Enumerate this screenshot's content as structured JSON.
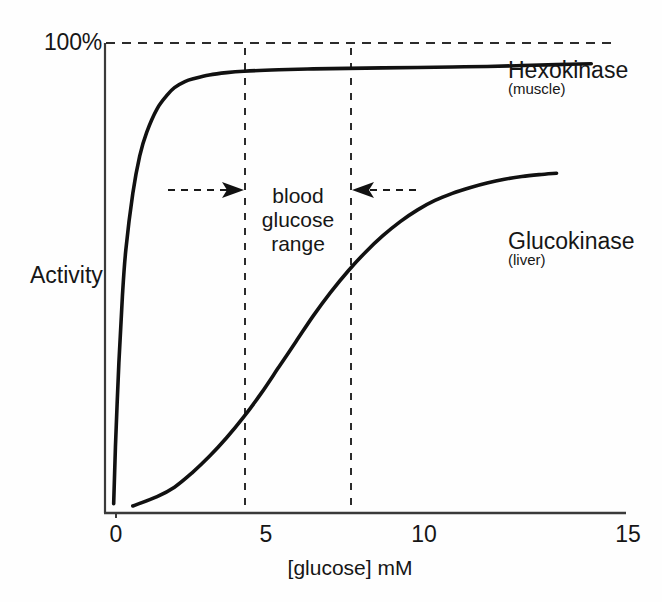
{
  "chart_data": {
    "type": "line",
    "title": "",
    "subtitle": "",
    "xlabel": "[glucose] mM",
    "ylabel": "Activity",
    "xlim": [
      0,
      15
    ],
    "ylim": [
      0,
      100
    ],
    "xticks": [
      0,
      5,
      10,
      15
    ],
    "xticklabels": [
      "0",
      "5",
      "10",
      "15"
    ],
    "yticklabels": [
      "100%"
    ],
    "grid": false,
    "legend_position": "inline-right-of-curves",
    "reference_lines": [
      {
        "name": "100-percent-line",
        "orientation": "horizontal",
        "value": 100,
        "style": "dashed",
        "label": "100%"
      },
      {
        "name": "blood-glucose-range-lower",
        "orientation": "vertical",
        "value": 4,
        "style": "dashed"
      },
      {
        "name": "blood-glucose-range-upper",
        "orientation": "vertical",
        "value": 7,
        "style": "dashed"
      }
    ],
    "annotations": [
      {
        "name": "blood-glucose-range",
        "text_lines": [
          "blood",
          "glucose",
          "range"
        ],
        "x_range": [
          4,
          7
        ],
        "y": 62
      }
    ],
    "series": [
      {
        "name": "Hexokinase",
        "sublabel": "(muscle)",
        "color": "#111111",
        "x": [
          0.25,
          0.3,
          0.4,
          0.5,
          0.6,
          0.8,
          1.0,
          1.2,
          1.5,
          1.8,
          2.0,
          2.3,
          2.6,
          3.0,
          3.5,
          4.0,
          5.0,
          6.0,
          7.0,
          8.0,
          9.0,
          10.0,
          11.0,
          12.0,
          13.0,
          14.0
        ],
        "y": [
          2,
          14,
          32,
          46,
          56,
          68,
          76,
          81,
          86,
          89,
          90.5,
          91.8,
          92.5,
          93.2,
          93.7,
          94.0,
          94.3,
          94.5,
          94.6,
          94.7,
          94.8,
          94.9,
          95.0,
          95.2,
          95.4,
          95.6
        ]
      },
      {
        "name": "Glucokinase",
        "sublabel": "(liver)",
        "color": "#111111",
        "x": [
          0.8,
          1.5,
          2.0,
          2.5,
          3.0,
          3.5,
          4.0,
          4.5,
          5.0,
          5.5,
          6.0,
          6.5,
          7.0,
          7.5,
          8.0,
          8.5,
          9.0,
          9.5,
          10.0,
          10.5,
          11.0,
          11.5,
          12.0,
          12.5,
          13.0
        ],
        "y": [
          1.5,
          3.5,
          5.5,
          8.5,
          12.0,
          16.0,
          20.5,
          25.5,
          31.0,
          36.5,
          42.0,
          47.0,
          51.5,
          55.5,
          59.0,
          62.0,
          64.5,
          66.5,
          68.0,
          69.2,
          70.2,
          71.0,
          71.6,
          72.0,
          72.3
        ]
      }
    ]
  },
  "axes": {
    "y_max_label": "100%",
    "y_title": "Activity",
    "x_title": "[glucose] mM",
    "xticklabels": {
      "t0": "0",
      "t5": "5",
      "t10": "10",
      "t15": "15"
    }
  },
  "labels": {
    "hexokinase": "Hexokinase",
    "hexokinase_sub": "(muscle)",
    "glucokinase": "Glucokinase",
    "glucokinase_sub": "(liver)",
    "range_line1": "blood",
    "range_line2": "glucose",
    "range_line3": "range"
  },
  "colors": {
    "ink": "#111111",
    "axis": "#3a3a3a",
    "background": "#fefefe",
    "dashed": "#2b2b2b"
  }
}
